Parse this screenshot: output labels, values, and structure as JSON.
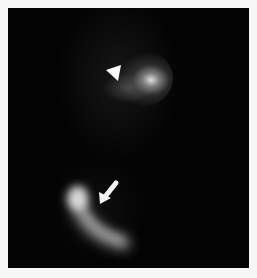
{
  "image": {
    "description": "Grayscale scintigraphy-style image on black background with white border",
    "background_color": "#030303",
    "border_color": "#f7f7f7",
    "annotations": [
      {
        "type": "arrowhead",
        "name": "arrowhead-marker",
        "points_to": "upper bright focus",
        "color": "#ffffff"
      },
      {
        "type": "arrow",
        "name": "arrow-marker",
        "points_to": "lower curved bright uptake",
        "color": "#ffffff"
      }
    ],
    "regions": [
      {
        "name": "upper-uptake-focus",
        "shape": "rounded blob"
      },
      {
        "name": "lower-curved-uptake",
        "shape": "crescent / curved band"
      }
    ]
  }
}
